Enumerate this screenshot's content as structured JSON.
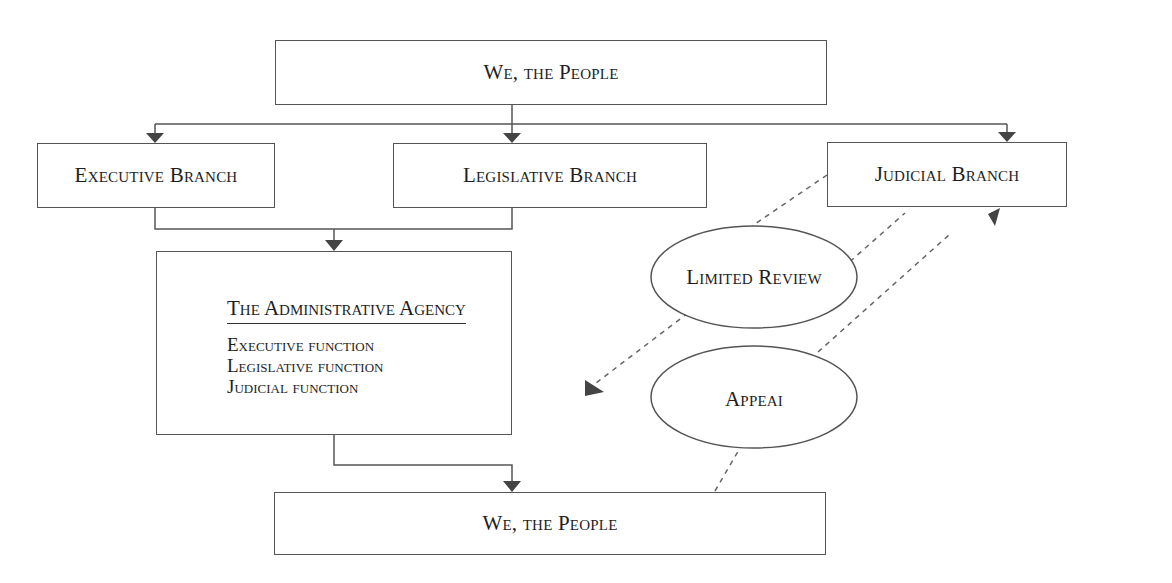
{
  "diagram": {
    "top_box": {
      "label": "We, the People"
    },
    "branches": [
      {
        "id": "executive",
        "label": "Executive Branch"
      },
      {
        "id": "legislative",
        "label": "Legislative Branch"
      },
      {
        "id": "judicial",
        "label": "Judicial Branch"
      }
    ],
    "agency": {
      "title": "The Administrative Agency",
      "functions": [
        "Executive function",
        "Legislative function",
        "Judicial function"
      ]
    },
    "ellipses": [
      {
        "id": "limited-review",
        "label": "Limited Review"
      },
      {
        "id": "appeal",
        "label": "Appeai"
      }
    ],
    "bottom_box": {
      "label": "We, the People"
    },
    "colors": {
      "line": "#555555",
      "arrow": "#444444",
      "dashed": "#666666"
    }
  }
}
